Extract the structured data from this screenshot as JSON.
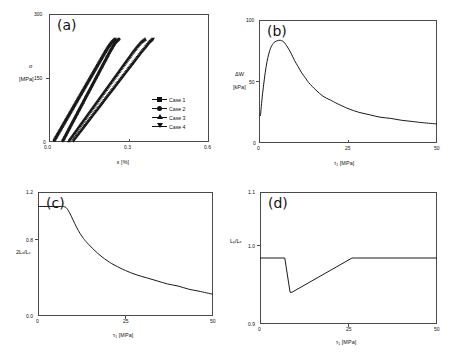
{
  "figure": {
    "background_color": "#ffffff",
    "line_color": "#1a1a1a",
    "axis_color": "#4a4a4a",
    "panel_count": 4
  },
  "panels": [
    {
      "tag": "(a)",
      "ylabel_line1": "σ",
      "ylabel_line2": "[MPa]",
      "xlabel": "ε [%]",
      "xticks": [
        "0.0",
        "0.3",
        "0.6"
      ],
      "yticks": [
        "0",
        "150",
        "300"
      ],
      "legend": [
        {
          "label": "Case 1",
          "marker": "square"
        },
        {
          "label": "Case 2",
          "marker": "circle"
        },
        {
          "label": "Case 3",
          "marker": "triangle-up"
        },
        {
          "label": "Case 4",
          "marker": "triangle-down"
        }
      ]
    },
    {
      "tag": "(b)",
      "ylabel_line1": "ΔW",
      "ylabel_line2": "[kPa]",
      "xlabel": "τ₁ [MPa]",
      "xticks": [
        "0",
        "25",
        "50"
      ],
      "yticks": [
        "0",
        "50",
        "100"
      ]
    },
    {
      "tag": "(c)",
      "ylabel_line1": "2Lₓ/Lₛ",
      "ylabel_line2": "",
      "xlabel": "τ₁ [MPa]",
      "xticks": [
        "0",
        "25",
        "50"
      ],
      "yticks": [
        "0.0",
        "0.8",
        "1.2"
      ]
    },
    {
      "tag": "(d)",
      "ylabel_line1": "Lᵧ/Lₓ",
      "ylabel_line2": "",
      "xlabel": "τ₁ [MPa]",
      "xticks": [
        "0",
        "25",
        "50"
      ],
      "yticks": [
        "0.9",
        "1.0",
        "1.1"
      ]
    }
  ],
  "chart_data": [
    {
      "type": "scatter",
      "panel": "(a)",
      "title": "",
      "xlabel": "ε [%]",
      "ylabel": "σ [MPa]",
      "xlim": [
        0.0,
        0.6
      ],
      "ylim": [
        0,
        300
      ],
      "xticks": [
        0.0,
        0.3,
        0.6
      ],
      "yticks": [
        0,
        150,
        300
      ],
      "grid": false,
      "legend_position": "lower-right",
      "series": [
        {
          "name": "Case 1",
          "marker": "square",
          "x": [
            0.02,
            0.032,
            0.044,
            0.056,
            0.068,
            0.08,
            0.092,
            0.104,
            0.116,
            0.128,
            0.14,
            0.152,
            0.164,
            0.176,
            0.188,
            0.2,
            0.212,
            0.224,
            0.236,
            0.248
          ],
          "y": [
            4,
            17,
            30,
            43,
            56,
            69,
            82,
            95,
            108,
            121,
            134,
            147,
            160,
            173,
            186,
            199,
            212,
            224,
            234,
            241
          ]
        },
        {
          "name": "Case 2",
          "marker": "circle",
          "x": [
            0.052,
            0.063,
            0.074,
            0.085,
            0.096,
            0.107,
            0.118,
            0.129,
            0.14,
            0.151,
            0.162,
            0.173,
            0.184,
            0.195,
            0.206,
            0.217,
            0.228,
            0.239,
            0.25,
            0.262
          ],
          "y": [
            3,
            16,
            29,
            42,
            55,
            68,
            81,
            94,
            107,
            120,
            133,
            146,
            159,
            172,
            185,
            198,
            211,
            223,
            234,
            241
          ]
        },
        {
          "name": "Case 3",
          "marker": "triangle-up",
          "x": [
            0.075,
            0.09,
            0.105,
            0.12,
            0.135,
            0.15,
            0.165,
            0.18,
            0.195,
            0.21,
            0.225,
            0.24,
            0.255,
            0.27,
            0.285,
            0.3,
            0.315,
            0.33,
            0.345,
            0.36
          ],
          "y": [
            3,
            16,
            29,
            42,
            55,
            68,
            81,
            94,
            107,
            120,
            133,
            146,
            159,
            172,
            185,
            198,
            211,
            223,
            234,
            241
          ]
        },
        {
          "name": "Case 4",
          "marker": "triangle-down",
          "x": [
            0.092,
            0.108,
            0.124,
            0.14,
            0.156,
            0.172,
            0.188,
            0.204,
            0.22,
            0.236,
            0.252,
            0.268,
            0.284,
            0.3,
            0.316,
            0.332,
            0.348,
            0.364,
            0.378,
            0.39
          ],
          "y": [
            3,
            16,
            29,
            42,
            55,
            68,
            81,
            94,
            107,
            120,
            133,
            146,
            159,
            172,
            185,
            198,
            211,
            223,
            234,
            241
          ]
        }
      ]
    },
    {
      "type": "line",
      "panel": "(b)",
      "title": "",
      "xlabel": "τ₁ [MPa]",
      "ylabel": "ΔW [kPa]",
      "xlim": [
        0,
        50
      ],
      "ylim": [
        0,
        100
      ],
      "xticks": [
        0,
        25,
        50
      ],
      "yticks": [
        0,
        50,
        100
      ],
      "grid": false,
      "x": [
        0.4,
        1,
        2,
        3,
        4,
        5,
        6,
        7,
        8,
        9,
        10,
        11,
        12,
        13,
        14,
        16,
        18,
        20,
        22,
        25,
        28,
        31,
        34,
        37,
        40,
        43,
        46,
        50
      ],
      "y": [
        22,
        40,
        62,
        75,
        81,
        83,
        83.5,
        82,
        78,
        73,
        67,
        62,
        57,
        53,
        49,
        43,
        38,
        35,
        32,
        28,
        25,
        23,
        21,
        20,
        18.5,
        17.5,
        16.5,
        15.5
      ]
    },
    {
      "type": "line",
      "panel": "(c)",
      "title": "",
      "xlabel": "τ₁ [MPa]",
      "ylabel": "2Lₓ/Lₛ",
      "xlim": [
        0,
        50
      ],
      "ylim": [
        0.0,
        1.2
      ],
      "xticks": [
        0,
        25,
        50
      ],
      "yticks": [
        0.0,
        0.8,
        1.2
      ],
      "grid": false,
      "x": [
        0,
        2,
        4,
        6,
        7,
        8,
        9,
        10,
        11,
        12,
        13,
        14,
        16,
        18,
        20,
        22,
        25,
        28,
        31,
        34,
        37,
        40,
        43,
        46,
        50
      ],
      "y": [
        1.06,
        1.06,
        1.06,
        1.06,
        1.06,
        1.05,
        1.0,
        0.93,
        0.86,
        0.8,
        0.75,
        0.71,
        0.64,
        0.58,
        0.53,
        0.49,
        0.44,
        0.4,
        0.37,
        0.34,
        0.31,
        0.29,
        0.26,
        0.24,
        0.21
      ]
    },
    {
      "type": "line",
      "panel": "(d)",
      "title": "",
      "xlabel": "τ₁ [MPa]",
      "ylabel": "Lᵧ/Lₓ",
      "xlim": [
        0,
        50
      ],
      "ylim": [
        0.9,
        1.1
      ],
      "xticks": [
        0,
        25,
        50
      ],
      "yticks": [
        0.9,
        1.0,
        1.1
      ],
      "grid": false,
      "x": [
        0,
        6.5,
        7.0,
        8.5,
        9.0,
        26.0,
        27.0,
        50
      ],
      "y": [
        1.0,
        1.0,
        1.0,
        0.948,
        0.948,
        1.0,
        1.0,
        1.0
      ]
    }
  ]
}
